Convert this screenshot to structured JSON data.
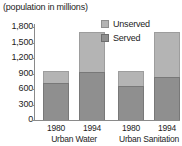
{
  "chart_data": {
    "type": "bar",
    "title": "(population in millions)",
    "subtitle": "",
    "xlabel": "",
    "ylabel": "",
    "ylim": [
      0,
      1800
    ],
    "grid": false,
    "stacked": true,
    "legend_position": "top-right",
    "y_ticks": [
      "0",
      "300",
      "600",
      "900",
      "1,200",
      "1,500",
      "1,800"
    ],
    "y_tick_values": [
      0,
      300,
      600,
      900,
      1200,
      1500,
      1800
    ],
    "categories": [
      "1980",
      "1994",
      "1980",
      "1994"
    ],
    "groups": [
      {
        "label": "Urban Water",
        "categories": [
          "1980",
          "1994"
        ]
      },
      {
        "label": "Urban Sanitation",
        "categories": [
          "1980",
          "1994"
        ]
      }
    ],
    "series": [
      {
        "name": "Served",
        "color": "#8f8f8f",
        "values": [
          720,
          930,
          660,
          840
        ]
      },
      {
        "name": "Unserved",
        "color": "#b4b4b4",
        "values": [
          230,
          770,
          290,
          860
        ]
      }
    ],
    "totals": [
      950,
      1700,
      950,
      1700
    ],
    "bars": [
      {
        "category": "1980",
        "group": "Urban Water",
        "served": 720,
        "unserved": 230,
        "total": 950
      },
      {
        "category": "1994",
        "group": "Urban Water",
        "served": 930,
        "unserved": 770,
        "total": 1700
      },
      {
        "category": "1980",
        "group": "Urban Sanitation",
        "served": 660,
        "unserved": 290,
        "total": 950
      },
      {
        "category": "1994",
        "group": "Urban Sanitation",
        "served": 840,
        "unserved": 860,
        "total": 1700
      }
    ],
    "legend": [
      {
        "label": "Unserved",
        "color": "#b4b4b4"
      },
      {
        "label": "Served",
        "color": "#8f8f8f"
      }
    ]
  }
}
